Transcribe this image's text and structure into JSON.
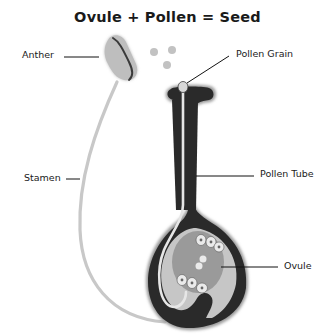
{
  "title": "Ovule + Pollen = Seed",
  "labels": {
    "anther": "Anther",
    "pollen_grain": "Pollen Grain",
    "stamen": "Stamen",
    "pollen_tube": "Pollen Tube",
    "ovule": "Ovule"
  },
  "colors": {
    "pistil_dark": "#2a2a2a",
    "light_gray": "#c4c4c4",
    "ovule_fill": "#9a9a9a",
    "leader_line": "#111111",
    "background": "#ffffff"
  }
}
